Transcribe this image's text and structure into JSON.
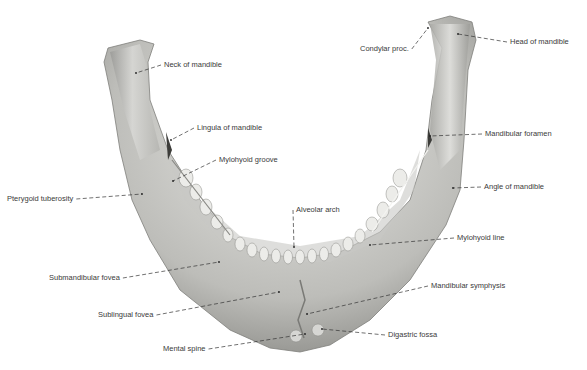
{
  "figure": {
    "background": "#ffffff",
    "bone_color": "#d8d8d6",
    "bone_shadow": "#8f8f8c",
    "leader_color": "#333333",
    "labels": [
      {
        "id": "neck",
        "text": "Neck of mandible",
        "x": 164,
        "y": 65,
        "tx": 136,
        "ty": 73
      },
      {
        "id": "condylar",
        "text": "Condylar proc.",
        "x": 360,
        "y": 49,
        "tx": 428,
        "ty": 28
      },
      {
        "id": "head",
        "text": "Head of mandible",
        "x": 510,
        "y": 42,
        "tx": 458,
        "ty": 34
      },
      {
        "id": "lingula",
        "text": "Lingula of mandible",
        "x": 197,
        "y": 128,
        "tx": 171,
        "ty": 140
      },
      {
        "id": "mylohyoid-groove",
        "text": "Mylohyoid groove",
        "x": 219,
        "y": 160,
        "tx": 173,
        "ty": 181
      },
      {
        "id": "mandibular-foramen",
        "text": "Mandibular foramen",
        "x": 485,
        "y": 134,
        "tx": 430,
        "ty": 136
      },
      {
        "id": "pterygoid",
        "text": "Pterygoid tuberosity",
        "x": 7,
        "y": 199,
        "tx": 142,
        "ty": 194
      },
      {
        "id": "angle",
        "text": "Angle of mandible",
        "x": 484,
        "y": 187,
        "tx": 453,
        "ty": 188
      },
      {
        "id": "alveolar",
        "text": "Alveolar arch",
        "x": 296,
        "y": 210,
        "tx": 294,
        "ty": 247
      },
      {
        "id": "mylohyoid-line",
        "text": "Mylohyoid line",
        "x": 457,
        "y": 238,
        "tx": 370,
        "ty": 245
      },
      {
        "id": "submandibular",
        "text": "Submandibular fovea",
        "x": 49,
        "y": 278,
        "tx": 219,
        "ty": 262
      },
      {
        "id": "mandibular-symphysis",
        "text": "Mandibular symphysis",
        "x": 431,
        "y": 286,
        "tx": 307,
        "ty": 314
      },
      {
        "id": "sublingual",
        "text": "Sublingual fovea",
        "x": 98,
        "y": 315,
        "tx": 279,
        "ty": 292
      },
      {
        "id": "digastric",
        "text": "Digastric fossa",
        "x": 388,
        "y": 335,
        "tx": 322,
        "ty": 329
      },
      {
        "id": "mental-spine",
        "text": "Mental spine",
        "x": 163,
        "y": 349,
        "tx": 305,
        "ty": 334
      }
    ]
  }
}
